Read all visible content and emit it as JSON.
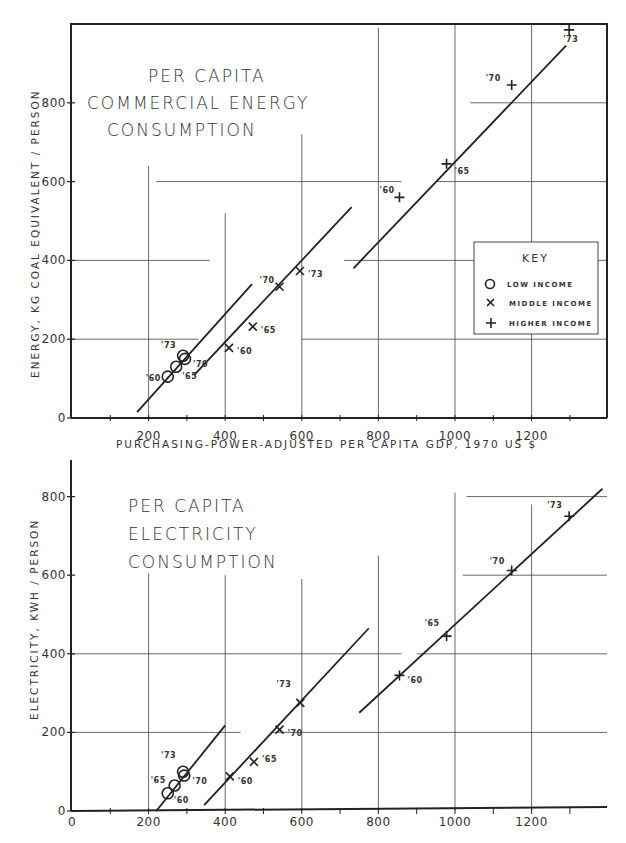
{
  "chart_data": [
    {
      "type": "scatter",
      "title": "PER CAPITA COMMERCIAL ENERGY CONSUMPTION",
      "title_lines": [
        "PER CAPITA",
        "COMMERCIAL ENERGY",
        "CONSUMPTION"
      ],
      "xlabel": "PURCHASING-POWER-ADJUSTED PER CAPITA GDP, 1970 US $",
      "ylabel": "ENERGY, KG COAL EQUIVALENT / PERSON",
      "xlim": [
        0,
        1400
      ],
      "ylim": [
        0,
        1000
      ],
      "x_ticks": [
        200,
        400,
        600,
        800,
        1000,
        1200
      ],
      "y_ticks": [
        0,
        200,
        400,
        600,
        800
      ],
      "grid": true,
      "legend": {
        "title": "KEY",
        "position": "right-middle",
        "entries": [
          {
            "marker": "circle",
            "label": "LOW INCOME"
          },
          {
            "marker": "x",
            "label": "MIDDLE INCOME"
          },
          {
            "marker": "plus",
            "label": "HIGHER INCOME"
          }
        ]
      },
      "series": [
        {
          "name": "LOW INCOME",
          "marker": "circle",
          "points": [
            {
              "year": "'60",
              "x": 250,
              "y": 105
            },
            {
              "year": "'65",
              "x": 272,
              "y": 130
            },
            {
              "year": "'70",
              "x": 295,
              "y": 150
            },
            {
              "year": "'73",
              "x": 290,
              "y": 158
            }
          ],
          "trend": {
            "x": [
              170,
              470
            ],
            "y": [
              15,
              340
            ]
          }
        },
        {
          "name": "MIDDLE INCOME",
          "marker": "x",
          "points": [
            {
              "year": "'60",
              "x": 410,
              "y": 178
            },
            {
              "year": "'65",
              "x": 472,
              "y": 232
            },
            {
              "year": "'70",
              "x": 542,
              "y": 333
            },
            {
              "year": "'73",
              "x": 595,
              "y": 373
            }
          ],
          "trend": {
            "x": [
              320,
              730
            ],
            "y": [
              110,
              535
            ]
          }
        },
        {
          "name": "HIGHER INCOME",
          "marker": "plus",
          "points": [
            {
              "year": "'60",
              "x": 855,
              "y": 560
            },
            {
              "year": "'65",
              "x": 978,
              "y": 645
            },
            {
              "year": "'70",
              "x": 1148,
              "y": 845
            },
            {
              "year": "'73",
              "x": 1298,
              "y": 985
            }
          ],
          "trend": {
            "x": [
              735,
              1290
            ],
            "y": [
              380,
              945
            ]
          }
        }
      ]
    },
    {
      "type": "scatter",
      "title": "PER CAPITA ELECTRICITY CONSUMPTION",
      "title_lines": [
        "PER CAPITA",
        "ELECTRICITY",
        "CONSUMPTION"
      ],
      "xlabel": "",
      "ylabel": "ELECTRICITY, KWH / PERSON",
      "xlim": [
        0,
        1400
      ],
      "ylim": [
        0,
        850
      ],
      "x_ticks": [
        0,
        200,
        400,
        600,
        800,
        1000,
        1200
      ],
      "y_ticks": [
        0,
        200,
        400,
        600,
        800
      ],
      "grid": true,
      "series": [
        {
          "name": "LOW INCOME",
          "marker": "circle",
          "points": [
            {
              "year": "'60",
              "x": 250,
              "y": 45
            },
            {
              "year": "'65",
              "x": 268,
              "y": 65
            },
            {
              "year": "'70",
              "x": 293,
              "y": 90
            },
            {
              "year": "'73",
              "x": 290,
              "y": 100
            }
          ],
          "trend": {
            "x": [
              220,
              400
            ],
            "y": [
              0,
              218
            ]
          }
        },
        {
          "name": "MIDDLE INCOME",
          "marker": "x",
          "points": [
            {
              "year": "'60",
              "x": 412,
              "y": 88
            },
            {
              "year": "'65",
              "x": 475,
              "y": 125
            },
            {
              "year": "'70",
              "x": 542,
              "y": 207
            },
            {
              "year": "'73",
              "x": 596,
              "y": 275
            }
          ],
          "trend": {
            "x": [
              345,
              775
            ],
            "y": [
              15,
              465
            ]
          }
        },
        {
          "name": "HIGHER INCOME",
          "marker": "plus",
          "points": [
            {
              "year": "'60",
              "x": 855,
              "y": 345
            },
            {
              "year": "'65",
              "x": 978,
              "y": 445
            },
            {
              "year": "'70",
              "x": 1148,
              "y": 612
            },
            {
              "year": "'73",
              "x": 1298,
              "y": 750
            }
          ],
          "trend": {
            "x": [
              750,
              1385
            ],
            "y": [
              250,
              820
            ]
          }
        }
      ]
    }
  ],
  "labels": {
    "top_title": [
      "PER CAPITA",
      "COMMERCIAL ENERGY",
      "CONSUMPTION"
    ],
    "bottom_title": [
      "PER CAPITA",
      "ELECTRICITY",
      "CONSUMPTION"
    ],
    "top_ylabel": "ENERGY, KG COAL EQUIVALENT / PERSON",
    "bottom_ylabel": "ELECTRICITY, KWH / PERSON",
    "xlabel": "PURCHASING-POWER-ADJUSTED PER CAPITA GDP, 1970 US $",
    "key_title": "KEY",
    "key_low": "LOW INCOME",
    "key_middle": "MIDDLE INCOME",
    "key_higher": "HIGHER INCOME",
    "x_ticks_top": [
      "200",
      "400",
      "600",
      "800",
      "1000",
      "1200"
    ],
    "x_ticks_bottom": [
      "0",
      "200",
      "400",
      "600",
      "800",
      "1000",
      "1200"
    ],
    "y_ticks": [
      "0",
      "200",
      "400",
      "600",
      "800"
    ]
  }
}
